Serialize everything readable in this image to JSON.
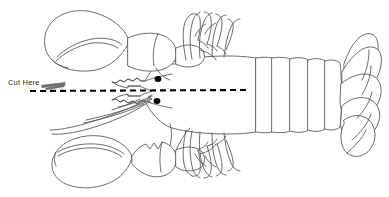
{
  "diagram": {
    "view": "dorsal whole-body outline, head at left, tail at right",
    "style": "black and white line drawing on white background",
    "canvas": {
      "width": 389,
      "height": 197,
      "background": "#ffffff"
    },
    "stroke_color": "#5a5a5a",
    "accent_color": "#000000"
  },
  "annotations": {
    "cut_here": {
      "label": "Cut Here",
      "x": 8,
      "y": 79,
      "icon": "arrow-pointer-icon",
      "points_to": "cut-line"
    }
  },
  "cut_line": {
    "name": "cut-line",
    "style": "dashed",
    "color": "#000000",
    "thickness": 2,
    "dash_pattern": "6 4",
    "start_x": 30,
    "end_x": 246,
    "y": 90,
    "description": "horizontal dashed line running from behind the antennae through the head and carapace to the first abdominal segment"
  },
  "parts": [
    {
      "name": "upper-claw",
      "label": "Claw (crusher)",
      "side": "upper-left",
      "count": 1
    },
    {
      "name": "lower-claw",
      "label": "Claw (pincer)",
      "side": "lower-left",
      "count": 1
    },
    {
      "name": "antennae",
      "label": "Antennae",
      "side": "lower-left",
      "count": 4
    },
    {
      "name": "rostrum",
      "label": "Rostrum",
      "side": "left-center",
      "count": 1
    },
    {
      "name": "eyes",
      "label": "Eyes",
      "side": "left-center",
      "count": 2
    },
    {
      "name": "carapace",
      "label": "Carapace",
      "side": "center",
      "count": 1
    },
    {
      "name": "walking-legs-upper",
      "label": "Walking legs (upper)",
      "side": "upper-center",
      "count": 4
    },
    {
      "name": "walking-legs-lower",
      "label": "Walking legs (lower)",
      "side": "lower-center",
      "count": 4
    },
    {
      "name": "abdomen-segments",
      "label": "Abdominal segments",
      "side": "right-center",
      "count": 5
    },
    {
      "name": "tail-fan",
      "label": "Tail fan (uropods and telson)",
      "side": "right",
      "count": 5
    }
  ],
  "eyes": [
    {
      "name": "eye-upper",
      "cx": 158,
      "cy": 79,
      "rx": 3.4,
      "ry": 3.0
    },
    {
      "name": "eye-lower",
      "cx": 157,
      "cy": 101,
      "rx": 3.4,
      "ry": 3.0
    }
  ]
}
